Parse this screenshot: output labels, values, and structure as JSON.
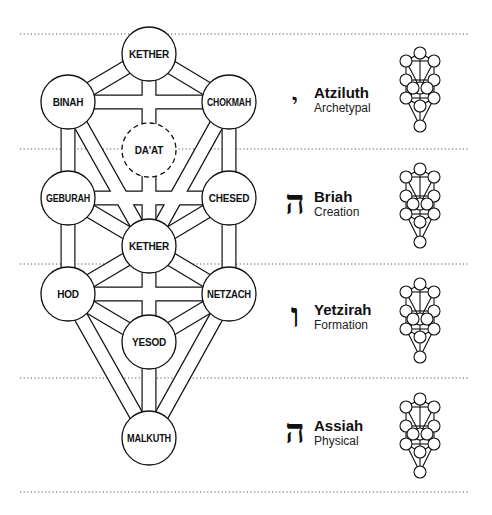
{
  "diagram": {
    "colors": {
      "stroke": "#111111",
      "fill": "#ffffff",
      "divider": "#555555"
    },
    "sephiroth": [
      {
        "id": "kether",
        "label": "KETHER",
        "cx": 149,
        "cy": 54,
        "dashed": false
      },
      {
        "id": "binah",
        "label": "BINAH",
        "cx": 68,
        "cy": 102,
        "dashed": false
      },
      {
        "id": "chokmah",
        "label": "CHOKMAH",
        "cx": 229,
        "cy": 102,
        "dashed": false
      },
      {
        "id": "daat",
        "label": "DA'AT",
        "cx": 149,
        "cy": 150,
        "dashed": true
      },
      {
        "id": "geburah",
        "label": "GEBURAH",
        "cx": 68,
        "cy": 198,
        "dashed": false
      },
      {
        "id": "chesed",
        "label": "CHESED",
        "cx": 229,
        "cy": 198,
        "dashed": false
      },
      {
        "id": "tiphareth",
        "label": "KETHER",
        "cx": 149,
        "cy": 246,
        "dashed": false
      },
      {
        "id": "hod",
        "label": "HOD",
        "cx": 68,
        "cy": 294,
        "dashed": false
      },
      {
        "id": "netzach",
        "label": "NETZACH",
        "cx": 229,
        "cy": 294,
        "dashed": false
      },
      {
        "id": "yesod",
        "label": "YESOD",
        "cx": 149,
        "cy": 342,
        "dashed": false
      },
      {
        "id": "malkuth",
        "label": "MALKUTH",
        "cx": 149,
        "cy": 438,
        "dashed": false
      }
    ],
    "worlds": [
      {
        "letter": "י",
        "letter_name": "Yod",
        "name": "Atziluth",
        "subtitle": "Archetypal",
        "top": 72,
        "letter_size": 22
      },
      {
        "letter": "ה",
        "letter_name": "He",
        "name": "Briah",
        "subtitle": "Creation",
        "top": 188,
        "letter_size": 30
      },
      {
        "letter": "ו",
        "letter_name": "Vav",
        "name": "Yetzirah",
        "subtitle": "Formation",
        "top": 303,
        "letter_size": 30
      },
      {
        "letter": "ה",
        "letter_name": "He",
        "name": "Assiah",
        "subtitle": "Physical",
        "top": 418,
        "letter_size": 30
      }
    ],
    "dividers_y": [
      34,
      149,
      264,
      378,
      492
    ]
  }
}
